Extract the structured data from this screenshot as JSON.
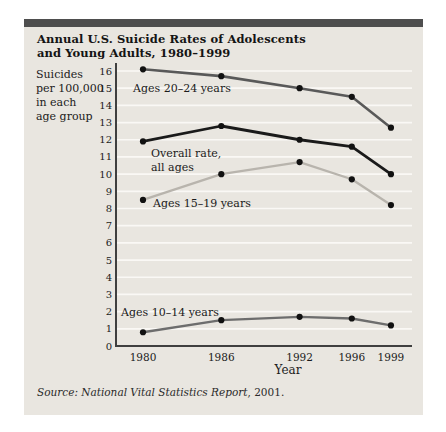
{
  "header": {
    "title_line1": "Annual U.S. Suicide Rates of Adolescents",
    "title_line2": "and Young Adults, 1980–1999"
  },
  "source": {
    "italic_part": "Source: National Vital Statistics Report",
    "roman_part": ", 2001."
  },
  "colors": {
    "panel_background": "#e9e6e0",
    "top_bar": "#4e4e4e",
    "gridline": "#fbfaf7",
    "axis": "#3f3f3f",
    "tick_text": "#1b1b1b",
    "point": "#111111"
  },
  "chart_data": {
    "type": "line",
    "title": "Annual U.S. Suicide Rates of Adolescents and Young Adults, 1980–1999",
    "xlabel": "Year",
    "ylabel": "Suicides per 100,000 in each age group",
    "ylabel_lines": [
      "Suicides",
      "per 100,000",
      "in each",
      "age group"
    ],
    "x": [
      1980,
      1986,
      1992,
      1996,
      1999
    ],
    "x_tick_labels": [
      "1980",
      "1986",
      "1992",
      "1996",
      "1999"
    ],
    "ylim": [
      0,
      16
    ],
    "y_tick_step": 1,
    "grid": "horizontal-white-lines-at-each-integer",
    "legend": "inline-labels-next-to-lines",
    "point_color": "#111111",
    "series": [
      {
        "name": "Ages 20–24 years",
        "values": [
          16.1,
          15.7,
          15.0,
          14.5,
          12.7
        ],
        "color": "#595959",
        "stroke_width": 2.6,
        "label_lines": [
          "Ages 20–24 years"
        ],
        "label_anchor_px": [
          133,
          92
        ]
      },
      {
        "name": "Overall rate, all ages",
        "values": [
          11.9,
          12.8,
          12.0,
          11.6,
          10.0
        ],
        "color": "#1a1a1a",
        "stroke_width": 2.8,
        "label_lines": [
          "Overall rate,",
          "all ages"
        ],
        "label_anchor_px": [
          151,
          157
        ]
      },
      {
        "name": "Ages 15–19 years",
        "values": [
          8.5,
          10.0,
          10.7,
          9.7,
          8.2
        ],
        "color": "#b8b4ad",
        "stroke_width": 2.3,
        "label_lines": [
          "Ages 15–19 years"
        ],
        "label_anchor_px": [
          153,
          207
        ]
      },
      {
        "name": "Ages 10–14 years",
        "values": [
          0.8,
          1.5,
          1.7,
          1.6,
          1.2
        ],
        "color": "#6d6d6d",
        "stroke_width": 2.3,
        "label_lines": [
          "Ages 10–14 years"
        ],
        "label_anchor_px": [
          121,
          316
        ]
      }
    ],
    "layout_px": {
      "axis_x": 116,
      "axis_top_y": 63,
      "axis_bottom_y": 346,
      "px_per_unit": 17.1875,
      "x_of_1980": 143,
      "px_per_year": 13.05,
      "grid_right_x": 412
    }
  }
}
